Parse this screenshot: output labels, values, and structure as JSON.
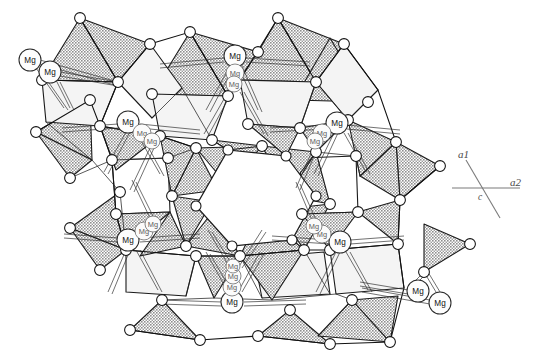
{
  "figure": {
    "kind": "crystal-structure-polyhedral-model",
    "background_color": "#ffffff",
    "width": 541,
    "height": 354
  },
  "colors": {
    "polyhedron_shaded": "#a8a8a8",
    "polyhedron_light": "#f0f0f0",
    "polyhedron_white": "#ffffff",
    "outline": "#1a1a1a",
    "atom_fill": "#ffffff",
    "atom_stroke": "#111111",
    "axis_stroke": "#7b7b7b",
    "label_text": "#111111"
  },
  "axis_legend": {
    "name": "crystallographic-axes",
    "a1_label": "a1",
    "a2_label": "a2",
    "c_label": "c"
  },
  "cation_label_text": "Mg",
  "cation_labels": [
    {
      "id": "mg-top-left-outer",
      "text": "Mg",
      "x": 30,
      "y": 60,
      "r": 11,
      "faint": false
    },
    {
      "id": "mg-top-left-inner",
      "text": "Mg",
      "x": 50,
      "y": 72,
      "r": 11,
      "faint": false
    },
    {
      "id": "mg-top-center-a",
      "text": "Mg",
      "x": 235,
      "y": 56,
      "r": 11,
      "faint": false
    },
    {
      "id": "mg-top-center-b",
      "text": "Mg",
      "x": 235,
      "y": 73,
      "r": 9,
      "faint": true
    },
    {
      "id": "mg-top-center-c",
      "text": "Mg",
      "x": 234,
      "y": 84,
      "r": 8,
      "faint": true
    },
    {
      "id": "mg-upper-left-a",
      "text": "Mg",
      "x": 128,
      "y": 122,
      "r": 11,
      "faint": false
    },
    {
      "id": "mg-upper-left-b",
      "text": "Mg",
      "x": 142,
      "y": 133,
      "r": 9,
      "faint": true
    },
    {
      "id": "mg-upper-left-c",
      "text": "Mg",
      "x": 152,
      "y": 141,
      "r": 8,
      "faint": true
    },
    {
      "id": "mg-upper-right-a",
      "text": "Mg",
      "x": 337,
      "y": 123,
      "r": 11,
      "faint": false
    },
    {
      "id": "mg-upper-right-b",
      "text": "Mg",
      "x": 322,
      "y": 133,
      "r": 9,
      "faint": true
    },
    {
      "id": "mg-upper-right-c",
      "text": "Mg",
      "x": 315,
      "y": 141,
      "r": 8,
      "faint": true
    },
    {
      "id": "mg-lower-left-a",
      "text": "Mg",
      "x": 128,
      "y": 240,
      "r": 11,
      "faint": false
    },
    {
      "id": "mg-lower-left-b",
      "text": "Mg",
      "x": 144,
      "y": 231,
      "r": 9,
      "faint": true
    },
    {
      "id": "mg-lower-left-c",
      "text": "Mg",
      "x": 153,
      "y": 224,
      "r": 8,
      "faint": true
    },
    {
      "id": "mg-lower-right-a",
      "text": "Mg",
      "x": 340,
      "y": 242,
      "r": 11,
      "faint": false
    },
    {
      "id": "mg-lower-right-b",
      "text": "Mg",
      "x": 322,
      "y": 234,
      "r": 9,
      "faint": true
    },
    {
      "id": "mg-lower-right-c",
      "text": "Mg",
      "x": 314,
      "y": 226,
      "r": 8,
      "faint": true
    },
    {
      "id": "mg-bottom-center-a",
      "text": "Mg",
      "x": 232,
      "y": 302,
      "r": 11,
      "faint": false
    },
    {
      "id": "mg-bottom-center-b",
      "text": "Mg",
      "x": 232,
      "y": 287,
      "r": 9,
      "faint": true
    },
    {
      "id": "mg-bottom-center-c",
      "text": "Mg",
      "x": 233,
      "y": 276,
      "r": 8,
      "faint": true
    },
    {
      "id": "mg-bottom-center-d",
      "text": "Mg",
      "x": 233,
      "y": 266,
      "r": 7,
      "faint": true
    },
    {
      "id": "mg-bottom-right-in",
      "text": "Mg",
      "x": 418,
      "y": 291,
      "r": 11,
      "faint": false
    },
    {
      "id": "mg-bottom-right-out",
      "text": "Mg",
      "x": 440,
      "y": 303,
      "r": 11,
      "faint": false
    }
  ],
  "chart_data": {
    "type": "diagram",
    "title": "",
    "subtitle": "",
    "structure_type": "ring silicate polyhedral framework",
    "symmetry": "six-fold about the central channel",
    "projection_axis": "c",
    "central_feature": "hexagonal channel",
    "polyhedra_count": 42,
    "vertex_atom_count": 54,
    "cation_site_label": "Mg",
    "cation_label_count": 23,
    "axes": [
      "a1",
      "a2",
      "c"
    ],
    "legend_position": "right",
    "grid": false
  }
}
